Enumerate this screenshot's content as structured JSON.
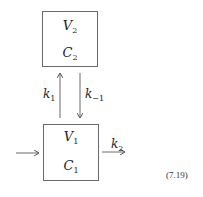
{
  "compartments": [
    {
      "id": "compartment-2",
      "volume": {
        "base": "V",
        "sub": "2"
      },
      "concentration": {
        "base": "C",
        "sub": "2"
      }
    },
    {
      "id": "compartment-1",
      "volume": {
        "base": "V",
        "sub": "1"
      },
      "concentration": {
        "base": "C",
        "sub": "1"
      }
    }
  ],
  "rates": {
    "k1": {
      "base": "k",
      "sub": "1"
    },
    "k_minus1": {
      "base": "k",
      "sub": "−1"
    },
    "k2": {
      "base": "k",
      "sub": "2"
    }
  },
  "equation_number": "(7.19)",
  "colors": {
    "line": "#6a6a6a",
    "text": "#222222"
  }
}
